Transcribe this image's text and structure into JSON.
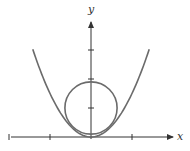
{
  "diagram": {
    "title": "",
    "x_axis_label": "x",
    "y_axis_label": "y",
    "x_ticks": [
      -2,
      -1,
      1
    ],
    "y_ticks": [
      1,
      2,
      3
    ],
    "x_range": [
      -2,
      2
    ],
    "y_range": [
      0,
      3.6
    ],
    "parabola": {
      "equation": "y = 1.5x^2",
      "coefficient": 1.5,
      "x_domain": [
        -1.42,
        1.42
      ]
    },
    "circle": {
      "center": [
        0,
        1
      ],
      "radius_y_units": 0.9
    },
    "colors": {
      "axis": "#333333",
      "curve": "#6b6b6b"
    }
  }
}
